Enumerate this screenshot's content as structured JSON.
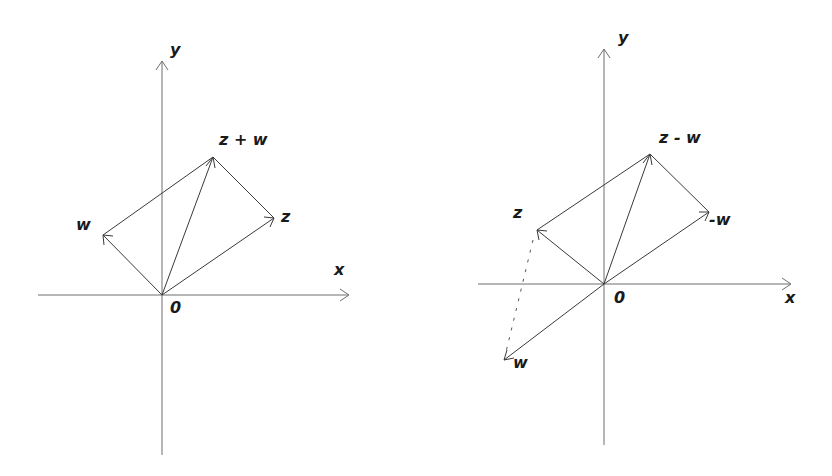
{
  "diagrams": [
    {
      "id": "addition",
      "labels": {
        "y_axis": "y",
        "x_axis": "x",
        "origin": "0",
        "sum": "z + w",
        "z": "z",
        "w": "w"
      },
      "origin": [
        162,
        295
      ],
      "points": {
        "z": [
          274,
          218
        ],
        "w": [
          103,
          235
        ],
        "sum": [
          213,
          157
        ]
      }
    },
    {
      "id": "subtraction",
      "labels": {
        "y_axis": "y",
        "x_axis": "x",
        "origin": "0",
        "difference": "z - w",
        "z": "z",
        "neg_w": "-w",
        "w": "w"
      },
      "origin": [
        604,
        284
      ],
      "points": {
        "z": [
          537,
          230
        ],
        "neg_w": [
          709,
          212
        ],
        "difference": [
          650,
          154
        ],
        "w": [
          504,
          360
        ]
      }
    }
  ],
  "colors": {
    "axis": "#6e6e6e",
    "vector": "#3a3a3a",
    "text": "#1a1a1a",
    "background": "#ffffff"
  }
}
